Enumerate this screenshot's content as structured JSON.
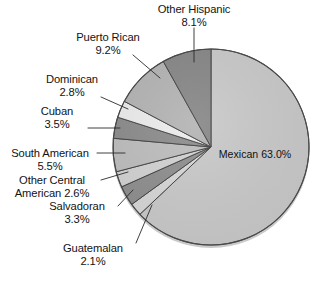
{
  "chart_data": {
    "type": "pie",
    "title": "",
    "subtitle": "",
    "xlabel": "",
    "ylabel": "",
    "legend_position": "none",
    "grid": false,
    "units": "percent",
    "start_angle_deg": 0,
    "direction": "clockwise",
    "categories": [
      "Mexican",
      "Guatemalan",
      "Salvadoran",
      "Other Central American",
      "South American",
      "Cuban",
      "Dominican",
      "Puerto Rican",
      "Other Hispanic"
    ],
    "values": [
      63.0,
      2.1,
      3.3,
      2.6,
      5.5,
      3.5,
      2.8,
      9.2,
      8.1
    ],
    "value_labels": [
      "63.0%",
      "2.1%",
      "3.3%",
      "2.6%",
      "5.5%",
      "3.5%",
      "2.8%",
      "9.2%",
      "8.1%"
    ],
    "colors": [
      "#c9c9c9",
      "#d7d7d7",
      "#8e8e8e",
      "#d2d2d2",
      "#bdbdbd",
      "#8b8b8b",
      "#ececec",
      "#b3b3b3",
      "#868686"
    ],
    "slice_outline_color": "#3a3a3a",
    "background_color": "#ffffff"
  },
  "slices": [
    {
      "name": "Mexican",
      "label": "Mexican",
      "percent": "63.0%",
      "value": 63.0,
      "color": "#c9c9c9",
      "label_placement": "inside"
    },
    {
      "name": "Guatemalan",
      "label": "Guatemalan",
      "percent": "2.1%",
      "value": 2.1,
      "color": "#d7d7d7",
      "label_placement": "outside"
    },
    {
      "name": "Salvadoran",
      "label": "Salvadoran",
      "percent": "3.3%",
      "value": 3.3,
      "color": "#8e8e8e",
      "label_placement": "outside"
    },
    {
      "name": "Other Central American",
      "label_line1": "Other Central",
      "label_line2": "American 2.6%",
      "percent": "2.6%",
      "value": 2.6,
      "color": "#d2d2d2",
      "label_placement": "outside"
    },
    {
      "name": "South American",
      "label": "South American",
      "percent": "5.5%",
      "value": 5.5,
      "color": "#bdbdbd",
      "label_placement": "outside"
    },
    {
      "name": "Cuban",
      "label": "Cuban",
      "percent": "3.5%",
      "value": 3.5,
      "color": "#8b8b8b",
      "label_placement": "outside"
    },
    {
      "name": "Dominican",
      "label": "Dominican",
      "percent": "2.8%",
      "value": 2.8,
      "color": "#ececec",
      "label_placement": "outside"
    },
    {
      "name": "Puerto Rican",
      "label": "Puerto Rican",
      "percent": "9.2%",
      "value": 9.2,
      "color": "#b3b3b3",
      "label_placement": "outside"
    },
    {
      "name": "Other Hispanic",
      "label": "Other Hispanic",
      "percent": "8.1%",
      "value": 8.1,
      "color": "#868686",
      "label_placement": "outside"
    }
  ]
}
